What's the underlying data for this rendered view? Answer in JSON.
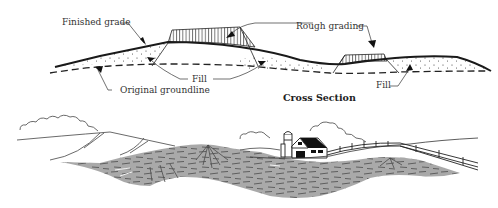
{
  "diagram": {
    "cross_section": {
      "title": "Cross Section",
      "labels": {
        "finished_grade": "Finished grade",
        "rough_grading": "Rough grading",
        "fill_left": "Fill",
        "fill_right": "Fill",
        "original_groundline": "Original groundline"
      },
      "legend_semantics": {
        "finished_grade_line": "solid thick line",
        "original_groundline_line": "dashed line",
        "rough_grading_area": "vertical hatching",
        "fill_area": "stippled dots"
      }
    },
    "landscape": {
      "elements": [
        "clouds",
        "hills",
        "barn",
        "silo",
        "fence",
        "graded-earth-band"
      ]
    },
    "colors": {
      "ink": "#222222",
      "earth_fill": "#a9a9a9",
      "earth_strokes": "#555555",
      "background": "#ffffff"
    }
  }
}
